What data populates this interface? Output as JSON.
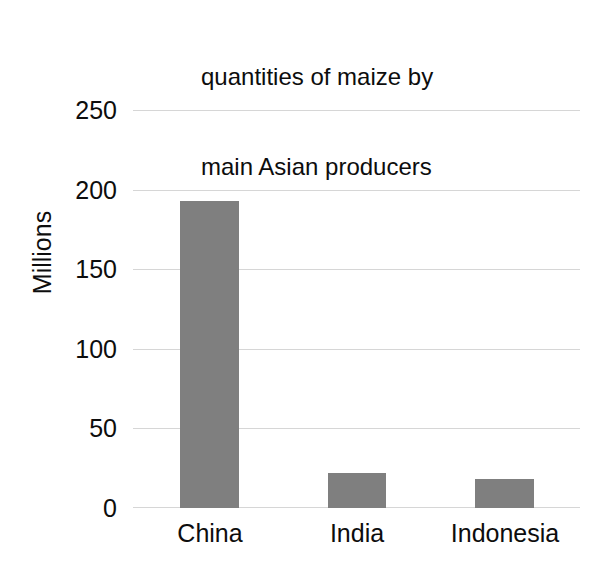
{
  "chart_data": {
    "type": "bar",
    "title": "quantities of maize by main Asian producers",
    "title_lines": [
      "quantities of maize by",
      "main Asian producers"
    ],
    "categories": [
      "China",
      "India",
      "Indonesia"
    ],
    "values": [
      193,
      22,
      18
    ],
    "xlabel": "",
    "ylabel": "Millions",
    "ylim": [
      0,
      250
    ],
    "yticks": [
      0,
      50,
      100,
      150,
      200,
      250
    ],
    "ytick_labels": [
      "0",
      "50",
      "100",
      "150",
      "200",
      "250"
    ],
    "grid": "horizontal",
    "legend": "none",
    "bar_color": "#7f7f7f",
    "gridline_color": "#d6d6d6",
    "text_color": "#0d0d0d",
    "background_color": "#ffffff"
  }
}
